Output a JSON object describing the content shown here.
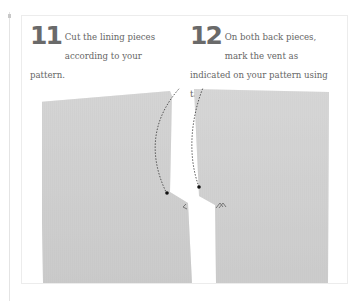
{
  "steps": [
    {
      "number": "11",
      "text": "Cut the lining pieces according to your pattern."
    },
    {
      "number": "12",
      "text": "On both back pieces, mark the vent as indicated on your pattern using tailor’s tacks."
    }
  ],
  "photo": {
    "subject": "two-back-lining-pieces-with-vent-marked",
    "fabric_color": "#cfcfcf",
    "markers": [
      "tailor-tack-left",
      "tailor-tack-right"
    ]
  },
  "colors": {
    "text": "#666666",
    "number": "#6a6a6a",
    "fabric": "#cfcfcf",
    "border": "#ececec"
  }
}
